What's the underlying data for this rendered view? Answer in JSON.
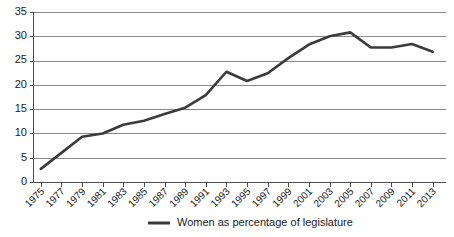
{
  "chart_data": {
    "type": "line",
    "title": "",
    "xlabel": "",
    "ylabel": "",
    "xlim": [
      1975,
      2013
    ],
    "ylim": [
      0,
      35
    ],
    "ytick_step": 5,
    "xtick_step": 2,
    "grid": "horizontal",
    "legend_position": "bottom-center",
    "series_color": "#3b3b3b",
    "categories": [
      "1975",
      "1977",
      "1979",
      "1981",
      "1983",
      "1985",
      "1987",
      "1989",
      "1991",
      "1993",
      "1995",
      "1997",
      "1999",
      "2001",
      "2003",
      "2005",
      "2007",
      "2009",
      "2011",
      "2013"
    ],
    "x_tick_labels": [
      "1975",
      "1977",
      "1979",
      "1981",
      "1983",
      "1985",
      "1987",
      "1989",
      "1991",
      "1993",
      "1995",
      "1997",
      "1999",
      "2001",
      "2003",
      "2005",
      "2007",
      "2009",
      "2011",
      "2013"
    ],
    "y_tick_labels": [
      "0",
      "5",
      "10",
      "15",
      "20",
      "25",
      "30",
      "35"
    ],
    "y_tick_values": [
      0,
      5,
      10,
      15,
      20,
      25,
      30,
      35
    ],
    "series": [
      {
        "name": "Women as percentage of legislature",
        "values": [
          2.7,
          6.0,
          9.3,
          10.0,
          11.8,
          12.6,
          14.0,
          15.3,
          17.9,
          22.7,
          20.8,
          22.4,
          25.5,
          28.3,
          30.0,
          30.8,
          27.7,
          27.7,
          28.4,
          26.8
        ]
      }
    ],
    "legend": [
      {
        "label": "Women as percentage of legislature",
        "color": "#3b3b3b"
      }
    ]
  },
  "legend": {
    "entry_label": "Women as percentage of legislature"
  }
}
